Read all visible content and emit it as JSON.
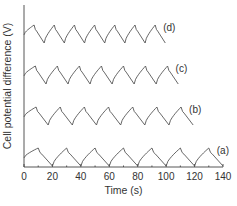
{
  "chart_data": {
    "type": "line",
    "title": "",
    "xlabel": "Time (s)",
    "ylabel": "Cell potential difference (V)",
    "xlim": [
      0,
      140
    ],
    "xticks": [
      "0",
      "20",
      "40",
      "60",
      "80",
      "100",
      "120",
      "140"
    ],
    "xtick_values": [
      0,
      20,
      40,
      60,
      80,
      100,
      120,
      140
    ],
    "grid": false,
    "legend": "inline labels at right end of each trace",
    "series": [
      {
        "name": "(a)",
        "label": "(a)",
        "period_s": 20,
        "cycles": 7,
        "peak_times_s": [
          10,
          30,
          50,
          70,
          90,
          110,
          130
        ],
        "min_times_s": [
          20,
          40,
          60,
          80,
          100,
          120,
          140
        ],
        "end_time_s": 140,
        "offset_rank": 0
      },
      {
        "name": "(b)",
        "label": "(b)",
        "period_s": 17,
        "cycles": 7,
        "peak_times_s": [
          8.5,
          25.5,
          42.5,
          59.5,
          76.5,
          93.5,
          110.5
        ],
        "min_times_s": [
          17,
          34,
          51,
          68,
          85,
          102,
          119
        ],
        "end_time_s": 126,
        "offset_rank": 1
      },
      {
        "name": "(c)",
        "label": "(c)",
        "period_s": 15.5,
        "cycles": 7,
        "peak_times_s": [
          8,
          23.5,
          39,
          54.5,
          70,
          85.5,
          101
        ],
        "min_times_s": [
          15.5,
          31,
          46.5,
          62,
          77.5,
          93,
          108.5
        ],
        "end_time_s": 114,
        "offset_rank": 2
      },
      {
        "name": "(d)",
        "label": "(d)",
        "period_s": 14.2,
        "cycles": 7,
        "peak_times_s": [
          7.1,
          21.3,
          35.5,
          49.7,
          63.9,
          78.1,
          92.3
        ],
        "min_times_s": [
          14.2,
          28.4,
          42.6,
          56.8,
          71,
          85.2,
          99.4
        ],
        "end_time_s": 103,
        "offset_rank": 3
      }
    ]
  }
}
